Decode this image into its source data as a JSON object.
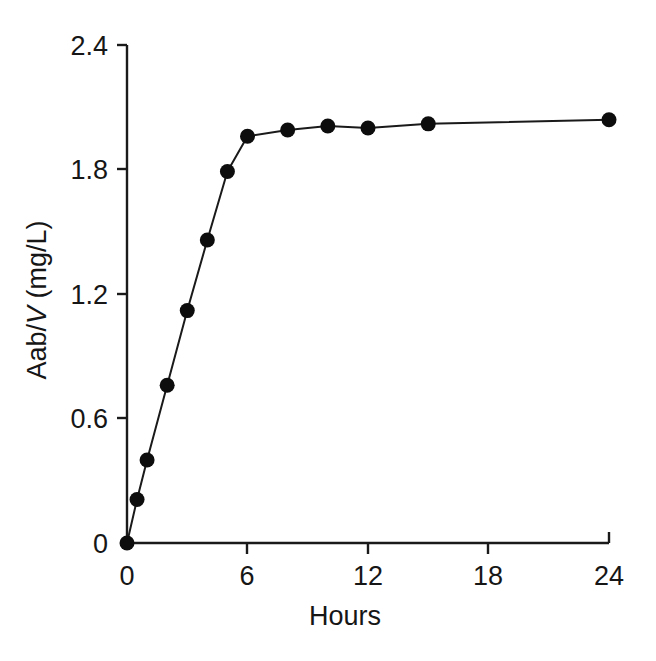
{
  "chart_data": {
    "type": "line",
    "title": "",
    "subtitle": "",
    "xlabel": "Hours",
    "ylabel": "Aab/V (mg/L)",
    "ylabel_parts": {
      "lead": "Aab/",
      "italic": "V",
      "trail": " (mg/L)"
    },
    "x": [
      0,
      0.5,
      1,
      2,
      3,
      4,
      5,
      6,
      8,
      10,
      12,
      15,
      24
    ],
    "values": [
      0,
      0.21,
      0.4,
      0.76,
      1.12,
      1.46,
      1.79,
      1.96,
      1.99,
      2.01,
      2.0,
      2.02,
      2.04
    ],
    "series": [
      {
        "name": "Aab/V",
        "x": [
          0,
          0.5,
          1,
          2,
          3,
          4,
          5,
          6,
          8,
          10,
          12,
          15,
          24
        ],
        "values": [
          0,
          0.21,
          0.4,
          0.76,
          1.12,
          1.46,
          1.79,
          1.96,
          1.99,
          2.01,
          2.0,
          2.02,
          2.04
        ]
      }
    ],
    "xlim": [
      0,
      24
    ],
    "ylim": [
      0,
      2.4
    ],
    "xticks": [
      0,
      6,
      12,
      18,
      24
    ],
    "xtick_labels": [
      "0",
      "6",
      "12",
      "18",
      "24"
    ],
    "yticks": [
      0,
      0.6,
      1.2,
      1.8,
      2.4
    ],
    "ytick_labels": [
      "0",
      "0.6",
      "1.2",
      "1.8",
      "2.4"
    ],
    "grid": false,
    "legend": false,
    "legend_position": "none",
    "marker": "filled-circle",
    "marker_color": "#0d0d0d",
    "line_color": "#1a1a1a",
    "background_color": "#ffffff",
    "annotations": []
  },
  "axis_labels": {
    "x_title": "Hours",
    "y_title": "Aab/V (mg/L)"
  },
  "ticks": {
    "y": [
      {
        "label": "2.4",
        "value": 2.4
      },
      {
        "label": "1.8",
        "value": 1.8
      },
      {
        "label": "1.2",
        "value": 1.2
      },
      {
        "label": "0.6",
        "value": 0.6
      },
      {
        "label": "0",
        "value": 0
      }
    ],
    "x": [
      {
        "label": "0",
        "value": 0
      },
      {
        "label": "6",
        "value": 6
      },
      {
        "label": "12",
        "value": 12
      },
      {
        "label": "18",
        "value": 18
      },
      {
        "label": "24",
        "value": 24
      }
    ]
  }
}
